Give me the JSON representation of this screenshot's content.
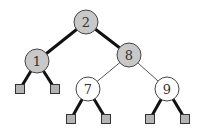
{
  "diagram": {
    "type": "binary-search-tree",
    "colors": {
      "gray_fill": "#c8c8c8",
      "white_fill": "#ffffff",
      "stroke": "#222222",
      "leaf_fill": "#b4b4b4"
    },
    "nodes": [
      {
        "id": "n2",
        "label": "2",
        "cx": 86,
        "cy": 22,
        "shade": "gray"
      },
      {
        "id": "n1",
        "label": "1",
        "cx": 37,
        "cy": 61,
        "shade": "gray"
      },
      {
        "id": "n8",
        "label": "8",
        "cx": 129,
        "cy": 55,
        "shade": "gray"
      },
      {
        "id": "n7",
        "label": "7",
        "cx": 88,
        "cy": 89,
        "shade": "white"
      },
      {
        "id": "n9",
        "label": "9",
        "cx": 167,
        "cy": 89,
        "shade": "white"
      }
    ],
    "leaves": [
      {
        "id": "l1",
        "x": 20,
        "y": 89
      },
      {
        "id": "l2",
        "x": 55,
        "y": 89
      },
      {
        "id": "l3",
        "x": 71,
        "y": 119
      },
      {
        "id": "l4",
        "x": 106,
        "y": 119
      },
      {
        "id": "l5",
        "x": 150,
        "y": 119
      },
      {
        "id": "l6",
        "x": 185,
        "y": 119
      }
    ],
    "edges": [
      {
        "from": "n2",
        "to": "n1",
        "style": "thick"
      },
      {
        "from": "n2",
        "to": "n8",
        "style": "thick"
      },
      {
        "from": "n1",
        "to": "l1",
        "style": "thick"
      },
      {
        "from": "n1",
        "to": "l2",
        "style": "thick"
      },
      {
        "from": "n8",
        "to": "n7",
        "style": "thin"
      },
      {
        "from": "n8",
        "to": "n9",
        "style": "thin"
      },
      {
        "from": "n7",
        "to": "l3",
        "style": "thick"
      },
      {
        "from": "n7",
        "to": "l4",
        "style": "thick"
      },
      {
        "from": "n9",
        "to": "l5",
        "style": "thick"
      },
      {
        "from": "n9",
        "to": "l6",
        "style": "thick"
      }
    ]
  }
}
